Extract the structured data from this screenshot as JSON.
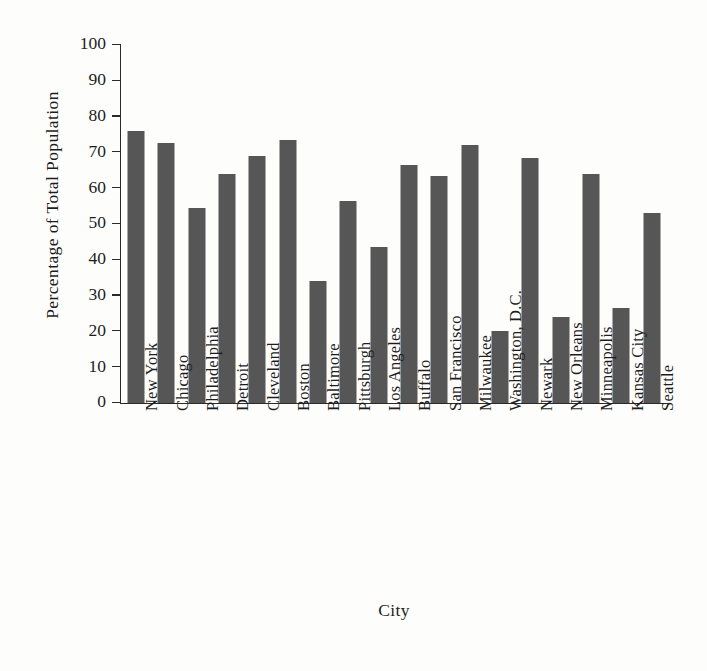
{
  "chart_data": {
    "type": "bar",
    "title": "",
    "xlabel": "City",
    "ylabel": "Percentage of Total Population",
    "ylim": [
      0,
      100
    ],
    "yticks": [
      0,
      10,
      20,
      30,
      40,
      50,
      60,
      70,
      80,
      90,
      100
    ],
    "grid": false,
    "legend": null,
    "bar_color": "#565656",
    "axis_color": "#2a2a2a",
    "categories": [
      "New York",
      "Chicago",
      "Philadelphia",
      "Detroit",
      "Cleveland",
      "Boston",
      "Baltimore",
      "Pittsburgh",
      "Los Angeles",
      "Buffalo",
      "San Francisco",
      "Milwaukee",
      "Washington, D.C.",
      "Newark",
      "New Orleans",
      "Minneapolis",
      "Kansas City",
      "Seattle"
    ],
    "values": [
      76,
      72.5,
      54.5,
      64,
      69,
      73.5,
      34,
      56.5,
      43.5,
      66.5,
      63.5,
      72,
      20,
      68.5,
      24,
      64,
      26.5,
      53
    ]
  }
}
